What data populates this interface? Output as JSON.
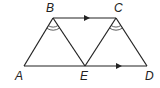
{
  "diagram": {
    "points": {
      "A": {
        "label": "A",
        "x": 24,
        "y": 66
      },
      "B": {
        "label": "B",
        "x": 53,
        "y": 18
      },
      "C": {
        "label": "C",
        "x": 116,
        "y": 18
      },
      "D": {
        "label": "D",
        "x": 147,
        "y": 66
      },
      "E": {
        "label": "E",
        "x": 85,
        "y": 66
      }
    },
    "segments": [
      "AB",
      "BE",
      "EC",
      "CD",
      "BC",
      "AD"
    ],
    "parallel_marks": [
      "BC",
      "ED"
    ],
    "congruent_angle_marks": [
      "ABE",
      "ECD"
    ]
  }
}
